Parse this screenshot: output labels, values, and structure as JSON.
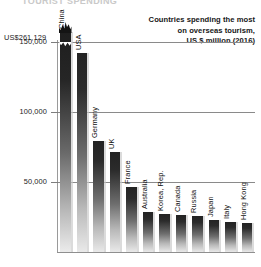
{
  "page": {
    "cropped_title": "TOURIST SPENDING"
  },
  "caption": {
    "line1": "Countries spending the most",
    "line2": "on overseas tourism,",
    "line3": "US $ million (2016)"
  },
  "callout": {
    "china_value_label": "US$261,129"
  },
  "chart_data": {
    "type": "bar",
    "title": "Countries spending the most on overseas tourism, US $ million (2016)",
    "xlabel": "",
    "ylabel": "US $ million",
    "ylim": [
      0,
      175000
    ],
    "grid": true,
    "legend": "none",
    "yticks": [
      50000,
      100000,
      150000
    ],
    "ytick_labels": [
      "50,000",
      "100,000",
      "150,000"
    ],
    "axis_broken": true,
    "broken_bar_category": "China",
    "broken_bar_true_value": 261129,
    "broken_bar_display_label": "US$261,129",
    "categories": [
      "China",
      "USA",
      "Germany",
      "UK",
      "France",
      "Australia",
      "Korea, Rep.",
      "Canada",
      "Russia",
      "Japan",
      "Italy",
      "Hong Kong"
    ],
    "values": [
      261129,
      165800,
      93700,
      84100,
      54700,
      34000,
      31800,
      31200,
      30500,
      27000,
      25600,
      24800
    ]
  },
  "bars": [
    {
      "label": "China",
      "value": 261129,
      "px_height": 220,
      "truncated": true,
      "label_px": 196
    },
    {
      "label": "USA",
      "value": 165800,
      "px_height": 199,
      "truncated": false,
      "label_px": 168
    },
    {
      "label": "Germany",
      "value": 93700,
      "px_height": 111,
      "truncated": false,
      "label_px": 80
    },
    {
      "label": "UK",
      "value": 84100,
      "px_height": 100,
      "truncated": false,
      "label_px": 69
    },
    {
      "label": "France",
      "value": 54700,
      "px_height": 65,
      "truncated": false,
      "label_px": 34
    },
    {
      "label": "Australia",
      "value": 34000,
      "px_height": 40,
      "truncated": false,
      "label_px": 9
    },
    {
      "label": "Korea, Rep.",
      "value": 31800,
      "px_height": 38,
      "truncated": false,
      "label_px": 7
    },
    {
      "label": "Canada",
      "value": 31200,
      "px_height": 37,
      "truncated": false,
      "label_px": 6
    },
    {
      "label": "Russia",
      "value": 30500,
      "px_height": 36,
      "truncated": false,
      "label_px": 5
    },
    {
      "label": "Japan",
      "value": 27000,
      "px_height": 32,
      "truncated": false,
      "label_px": 1
    },
    {
      "label": "Italy",
      "value": 25600,
      "px_height": 30,
      "truncated": false,
      "label_px": -1
    },
    {
      "label": "Hong Kong",
      "value": 24800,
      "px_height": 29,
      "truncated": false,
      "label_px": -2
    }
  ]
}
